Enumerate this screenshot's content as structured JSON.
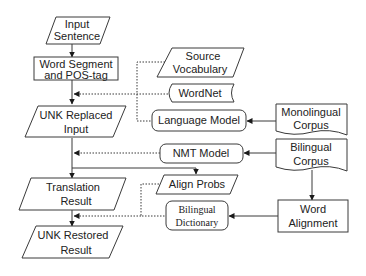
{
  "diagram": {
    "type": "flowchart",
    "colors": {
      "stroke": "#3a3a3a",
      "fill": "#ffffff",
      "text": "#222222"
    },
    "nodes": {
      "input_sentence": {
        "shape": "parallelogram",
        "line1": "Input",
        "line2": "Sentence"
      },
      "word_segment": {
        "shape": "rectangle",
        "line1": "Word Segment",
        "line2": "and POS-tag"
      },
      "unk_replaced": {
        "shape": "parallelogram",
        "line1": "UNK Replaced",
        "line2": "Input"
      },
      "translation_result": {
        "shape": "parallelogram",
        "line1": "Translation",
        "line2": "Result"
      },
      "unk_restored": {
        "shape": "parallelogram",
        "line1": "UNK Restored",
        "line2": "Result"
      },
      "source_vocabulary": {
        "shape": "parallelogram",
        "line1": "Source",
        "line2": "Vocabulary"
      },
      "wordnet": {
        "shape": "stored-data",
        "label": "WordNet"
      },
      "language_model": {
        "shape": "rounded-rectangle",
        "label": "Language Model"
      },
      "monolingual_corpus": {
        "shape": "document",
        "line1": "Monolingual",
        "line2": "Corpus"
      },
      "nmt_model": {
        "shape": "rounded-rectangle",
        "label": "NMT Model"
      },
      "bilingual_corpus": {
        "shape": "document",
        "line1": "Bilingual",
        "line2": "Corpus"
      },
      "align_probs": {
        "shape": "parallelogram",
        "label": "Align Probs"
      },
      "bilingual_dictionary": {
        "shape": "rounded-rectangle",
        "line1": "Bilingual",
        "line2": "Dictionary"
      },
      "word_alignment": {
        "shape": "rectangle",
        "line1": "Word",
        "line2": "Alignment"
      }
    },
    "edges": [
      {
        "from": "input_sentence",
        "to": "word_segment",
        "style": "solid"
      },
      {
        "from": "word_segment",
        "to": "unk_replaced",
        "style": "solid"
      },
      {
        "from": "source_vocabulary",
        "to": "word_segment->unk_replaced",
        "style": "dotted"
      },
      {
        "from": "wordnet",
        "to": "word_segment->unk_replaced",
        "style": "dotted"
      },
      {
        "from": "language_model",
        "to": "word_segment->unk_replaced",
        "style": "dotted"
      },
      {
        "from": "monolingual_corpus",
        "to": "language_model",
        "style": "solid"
      },
      {
        "from": "unk_replaced",
        "to": "translation_result",
        "style": "solid"
      },
      {
        "from": "nmt_model",
        "to": "unk_replaced->translation_result",
        "style": "dotted"
      },
      {
        "from": "bilingual_corpus",
        "to": "nmt_model",
        "style": "solid"
      },
      {
        "from": "unk_replaced->translation_result",
        "to": "align_probs",
        "style": "solid"
      },
      {
        "from": "translation_result",
        "to": "unk_restored",
        "style": "solid"
      },
      {
        "from": "align_probs",
        "to": "translation_result->unk_restored",
        "style": "dotted"
      },
      {
        "from": "bilingual_dictionary",
        "to": "translation_result->unk_restored",
        "style": "dotted"
      },
      {
        "from": "bilingual_corpus",
        "to": "word_alignment",
        "style": "solid"
      },
      {
        "from": "word_alignment",
        "to": "bilingual_dictionary",
        "style": "solid"
      }
    ]
  }
}
